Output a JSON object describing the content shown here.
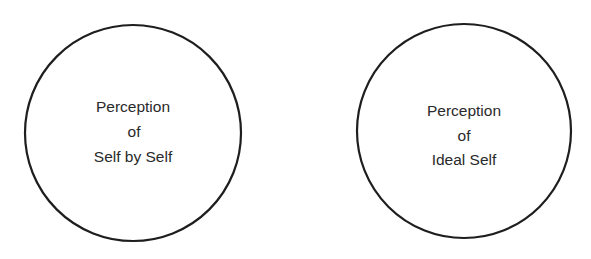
{
  "diagram": {
    "circles": [
      {
        "id": "self-by-self",
        "lines": [
          "Perception",
          "of",
          "Self by Self"
        ],
        "cx": 133,
        "cy": 133,
        "r": 108
      },
      {
        "id": "ideal-self",
        "lines": [
          "Perception",
          "of",
          "Ideal Self"
        ],
        "cx": 464,
        "cy": 131,
        "r": 107
      }
    ],
    "colors": {
      "stroke": "#1e1e1e",
      "text": "#2a2a2a",
      "background": "#ffffff"
    }
  }
}
